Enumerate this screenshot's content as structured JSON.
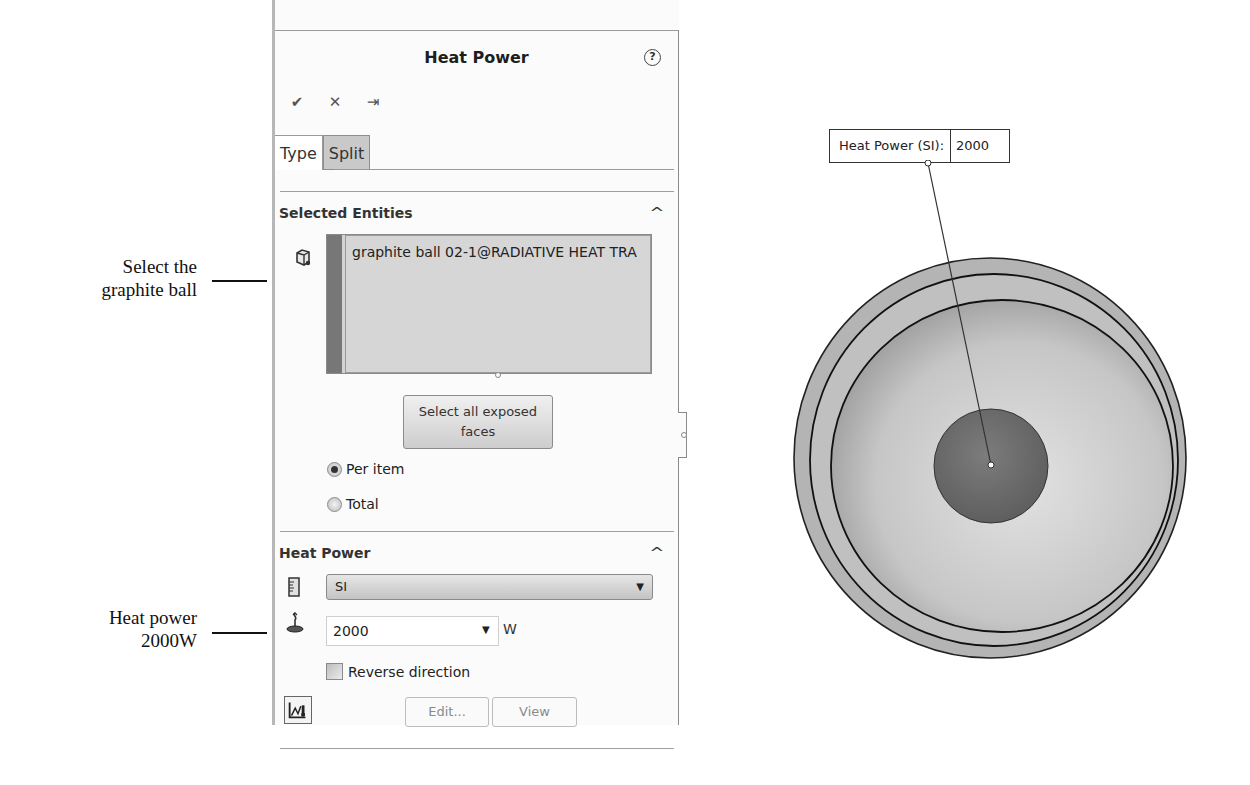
{
  "annotations": {
    "select_ball": [
      "Select the",
      "graphite ball"
    ],
    "heat_power": [
      "Heat power",
      "2000W"
    ]
  },
  "property_manager": {
    "title": "Heat Power",
    "help_icon": "?",
    "actions": {
      "ok_icon": "✔",
      "cancel_icon": "✕",
      "pin_icon": "⇥"
    },
    "tabs": [
      {
        "label": "Type",
        "active": true
      },
      {
        "label": "Split",
        "active": false
      }
    ],
    "selected_entities": {
      "title": "Selected Entities",
      "collapse_icon": "^",
      "items": [
        "graphite ball 02-1@RADIATIVE HEAT TRA"
      ],
      "select_all_button": [
        "Select all exposed",
        "faces"
      ],
      "distribution": {
        "options": [
          "Per item",
          "Total"
        ],
        "selected": "Per item"
      }
    },
    "heat_power": {
      "title": "Heat Power",
      "collapse_icon": "^",
      "unit_system": "SI",
      "value": "2000",
      "unit": "W",
      "reverse_direction_label": "Reverse direction",
      "reverse_direction_checked": false,
      "edit_button": "Edit...",
      "view_button": "View"
    }
  },
  "graphics": {
    "tag_label": "Heat Power (SI):",
    "tag_value": "2000"
  },
  "colors": {
    "panel_bg": "#fbfbfb",
    "selection_box": "#d6d6d6",
    "tab_inactive": "#c9c9c9",
    "model_outer": "#b0b0b0",
    "model_inner": "#cfcfcf",
    "ball": "#6e6e6e"
  }
}
